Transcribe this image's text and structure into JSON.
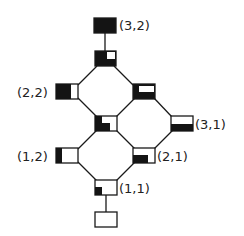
{
  "diagram": {
    "type": "lattice",
    "stroke_color": "#1a1a1a",
    "fill_color": "#141414",
    "nodes": [
      {
        "id": "n32",
        "label": "(3,2)",
        "fill": "full"
      },
      {
        "id": "n_top2",
        "label": "",
        "fill": "full-minus-top-right"
      },
      {
        "id": "n22",
        "label": "(2,2)",
        "fill": "left-two-thirds"
      },
      {
        "id": "n_right",
        "label": "",
        "fill": "left-and-bottom"
      },
      {
        "id": "n_mid",
        "label": "",
        "fill": "left-and-bottom-left"
      },
      {
        "id": "n31",
        "label": "(3,1)",
        "fill": "bottom-half"
      },
      {
        "id": "n12",
        "label": "(1,2)",
        "fill": "left-strip"
      },
      {
        "id": "n21",
        "label": "(2,1)",
        "fill": "bottom-left-band"
      },
      {
        "id": "n11",
        "label": "(1,1)",
        "fill": "bottom-left-corner"
      },
      {
        "id": "n_bottom",
        "label": "",
        "fill": "empty"
      }
    ],
    "edges": [
      [
        "n32",
        "n_top2"
      ],
      [
        "n_top2",
        "n22"
      ],
      [
        "n_top2",
        "n_right"
      ],
      [
        "n22",
        "n_mid"
      ],
      [
        "n_right",
        "n_mid"
      ],
      [
        "n_right",
        "n31"
      ],
      [
        "n_mid",
        "n12"
      ],
      [
        "n_mid",
        "n21"
      ],
      [
        "n31",
        "n21"
      ],
      [
        "n12",
        "n11"
      ],
      [
        "n21",
        "n11"
      ],
      [
        "n11",
        "n_bottom"
      ]
    ]
  }
}
